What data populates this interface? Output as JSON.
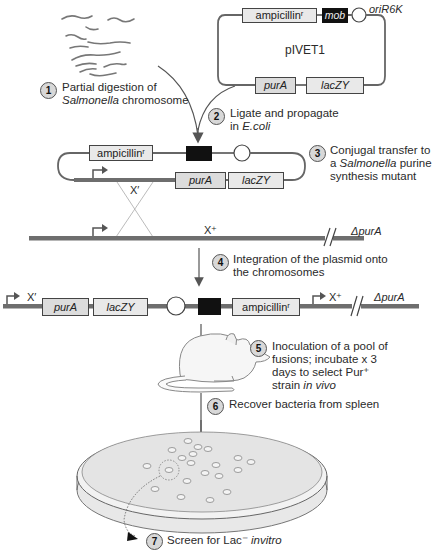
{
  "steps": [
    {
      "num": "1",
      "line1": "Partial digestion of",
      "line2_italic": "Salmonella",
      "line2_rest": " chromosome"
    },
    {
      "num": "2",
      "line1": "Ligate and propagate",
      "line2_prefix": "in ",
      "line2_italic": "E.coli"
    },
    {
      "num": "3",
      "line1": "Conjugal transfer to",
      "line2_prefix": "a ",
      "line2_italic": "Salmonella",
      "line2_rest": " purine",
      "line3": "synthesis mutant"
    },
    {
      "num": "4",
      "line1": "Integration of the plasmid onto",
      "line2": "the chromosomes"
    },
    {
      "num": "5",
      "line1": "Inoculation of a pool of",
      "line2": "fusions; incubate x 3",
      "line3": "days to select Pur⁺",
      "line4_prefix": "strain ",
      "line4_italic": "in vivo"
    },
    {
      "num": "6",
      "line1": "Recover bacteria from spleen"
    },
    {
      "num": "7",
      "line1": "Screen for Lac⁻ ",
      "line1_italic": "invitro"
    }
  ],
  "plasmid": {
    "name": "pIVET1",
    "ampicillin": "ampicillinʳ",
    "mob": "mob",
    "ori": "oriR6K",
    "purA": "purA",
    "lacZY": "lacZY"
  },
  "recombinant": {
    "ampicillin": "ampicillinʳ",
    "x_label": "X′",
    "purA": "purA",
    "lacZY": "lacZY"
  },
  "chromosome": {
    "x_label": "X⁺",
    "delta": "ΔpurA"
  },
  "integrated": {
    "x_prime": "X′",
    "purA": "purA",
    "lacZY": "lacZY",
    "ampicillin": "ampicillinʳ",
    "x_plus": "X⁺",
    "delta": "ΔpurA"
  },
  "icons": {
    "mouse": "mouse-illustration",
    "petri": "petri-dish-illustration",
    "fragments": "dna-fragments"
  },
  "colors": {
    "dna_bar": "#6e6e6e",
    "box_fill": "#e9e9e9",
    "step_circle": "#d8d8d8",
    "plate": "#e6e6e6"
  }
}
